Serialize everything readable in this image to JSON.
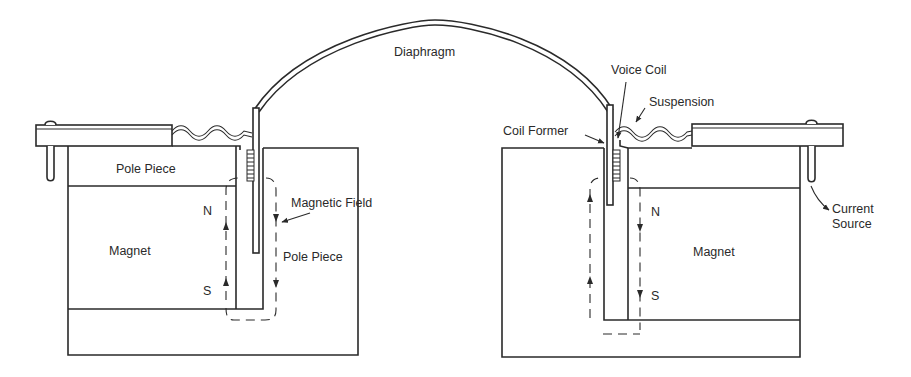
{
  "figure": {
    "type": "cross-section diagram"
  },
  "labels": {
    "diaphragm": "Diaphragm",
    "voice_coil": "Voice Coil",
    "suspension": "Suspension",
    "coil_former": "Coil Former",
    "pole_piece_top": "Pole Piece",
    "pole_piece_center": "Pole Piece",
    "magnetic_field": "Magnetic Field",
    "magnet_left": "Magnet",
    "magnet_right": "Magnet",
    "north_left": "N",
    "south_left": "S",
    "north_right": "N",
    "south_right": "S",
    "current_source_line1": "Current",
    "current_source_line2": "Source"
  },
  "colors": {
    "stroke": "#2a2a2a",
    "background": "#ffffff"
  }
}
